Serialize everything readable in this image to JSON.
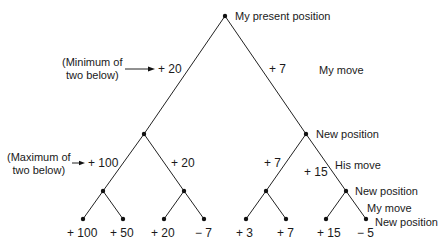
{
  "labels": {
    "root": "My present position",
    "my_move_1": "My move",
    "new_position_1": "New position",
    "his_move": "His move",
    "new_position_2": "New position",
    "my_move_2": "My move",
    "new_position_3": "New position"
  },
  "notes": {
    "minimum_line1": "(Minimum of",
    "minimum_line2": "two below)",
    "maximum_line1": "(Maximum of",
    "maximum_line2": "two below)"
  },
  "values": {
    "level1_left": "+ 20",
    "level1_right": "+ 7",
    "level2_ll": "+ 100",
    "level2_lr": "+ 20",
    "level2_rl": "+ 7",
    "level2_rr": "+ 15",
    "leaves": [
      "+ 100",
      "+ 50",
      "+ 20",
      "− 7",
      "+ 3",
      "+ 7",
      "+ 15",
      "− 5"
    ]
  }
}
